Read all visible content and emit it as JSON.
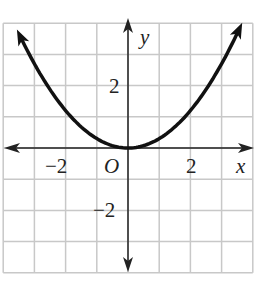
{
  "chart_data": {
    "type": "line",
    "title": "",
    "xlabel": "x",
    "ylabel": "y",
    "origin_label": "O",
    "xlim": [
      -4,
      4
    ],
    "ylim": [
      -4,
      4
    ],
    "grid": true,
    "x_ticks": [
      {
        "value": -2,
        "label": "−2"
      },
      {
        "value": 2,
        "label": "2"
      }
    ],
    "y_ticks": [
      {
        "value": 2,
        "label": "2"
      },
      {
        "value": -2,
        "label": "−2"
      }
    ],
    "series": [
      {
        "name": "curve",
        "equation": "y ≈ 0.3x²",
        "x": [
          -3.5,
          -3,
          -2,
          -1,
          0,
          1,
          2,
          3,
          3.6
        ],
        "values": [
          3.7,
          2.7,
          1.2,
          0.3,
          0,
          0.3,
          1.2,
          2.7,
          3.9
        ],
        "arrows_both_ends": true,
        "color": "#111111"
      }
    ],
    "colors": {
      "grid": "#c8c8c8",
      "axis": "#222222",
      "curve": "#111111"
    }
  }
}
